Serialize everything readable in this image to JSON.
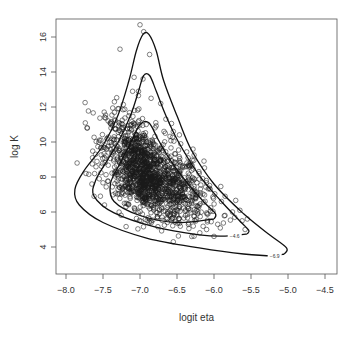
{
  "chart_data": {
    "type": "scatter",
    "title": "",
    "xlabel": "logit eta",
    "ylabel": "log K",
    "xlim": [
      -8.15,
      -4.35
    ],
    "ylim": [
      2.9,
      17.0
    ],
    "xticks": [
      -8.0,
      -7.5,
      -7.0,
      -6.5,
      -6.0,
      -5.5,
      -5.0,
      -4.5
    ],
    "xtick_labels": [
      "−8.0",
      "−7.5",
      "−7.0",
      "−6.5",
      "−6.0",
      "−5.5",
      "−5.0",
      "−4.5"
    ],
    "yticks": [
      4,
      6,
      8,
      10,
      12,
      14,
      16
    ],
    "ytick_labels": [
      "4",
      "6",
      "8",
      "10",
      "12",
      "14",
      "16"
    ],
    "grid": false,
    "legend": null,
    "marker": "open-circle",
    "point_color": "#1a1a1a",
    "contour_color": "#111111",
    "approx_n_points": 1500,
    "point_cloud": {
      "description": "dense cluster centered near logit eta = -6.9, log K = 8, skewed toward lower-right",
      "center": [
        -6.9,
        8.0
      ],
      "sd_x": 0.28,
      "sd_y": 1.25,
      "correlation": -0.55
    },
    "sparse_points": [
      [
        -7.0,
        16.7
      ],
      [
        -6.95,
        16.3
      ],
      [
        -7.27,
        15.3
      ],
      [
        -6.87,
        15.0
      ],
      [
        -7.08,
        13.7
      ],
      [
        -6.96,
        13.6
      ],
      [
        -7.6,
        9.3
      ],
      [
        -7.73,
        8.2
      ],
      [
        -7.85,
        8.8
      ],
      [
        -7.55,
        7.9
      ],
      [
        -7.62,
        6.9
      ],
      [
        -7.48,
        6.4
      ],
      [
        -7.65,
        7.6
      ],
      [
        -7.35,
        10.3
      ],
      [
        -7.25,
        10.8
      ],
      [
        -7.15,
        11.5
      ],
      [
        -6.72,
        12.2
      ],
      [
        -6.65,
        11.3
      ],
      [
        -6.55,
        10.6
      ],
      [
        -6.45,
        9.9
      ],
      [
        -6.35,
        9.1
      ],
      [
        -6.2,
        8.2
      ],
      [
        -6.05,
        7.3
      ],
      [
        -5.9,
        6.6
      ],
      [
        -5.75,
        6.0
      ],
      [
        -5.72,
        5.7
      ],
      [
        -5.62,
        5.5
      ],
      [
        -5.58,
        5.0
      ],
      [
        -5.95,
        5.3
      ],
      [
        -6.1,
        5.0
      ],
      [
        -6.55,
        4.3
      ],
      [
        -6.3,
        4.6
      ],
      [
        -5.55,
        5.6
      ],
      [
        -5.65,
        6.1
      ],
      [
        -7.1,
        12.9
      ],
      [
        -7.02,
        12.9
      ],
      [
        -6.85,
        12.5
      ],
      [
        -7.3,
        11.9
      ],
      [
        -6.5,
        8.8
      ],
      [
        -5.85,
        6.9
      ]
    ],
    "contours": [
      {
        "level": "-6.9",
        "label": "−6.9",
        "label_pos": [
          -5.18,
          3.5
        ],
        "path": [
          [
            -5.05,
            3.6
          ],
          [
            -5.2,
            3.5
          ],
          [
            -5.6,
            3.6
          ],
          [
            -6.2,
            3.95
          ],
          [
            -6.9,
            4.5
          ],
          [
            -7.5,
            5.4
          ],
          [
            -7.82,
            6.4
          ],
          [
            -7.88,
            7.3
          ],
          [
            -7.75,
            8.4
          ],
          [
            -7.5,
            9.8
          ],
          [
            -7.3,
            11.5
          ],
          [
            -7.15,
            13.5
          ],
          [
            -7.05,
            15.2
          ],
          [
            -6.96,
            16.15
          ],
          [
            -6.88,
            16.15
          ],
          [
            -6.78,
            15.2
          ],
          [
            -6.68,
            13.5
          ],
          [
            -6.5,
            11.5
          ],
          [
            -6.3,
            9.5
          ],
          [
            -6.0,
            7.6
          ],
          [
            -5.6,
            5.9
          ],
          [
            -5.25,
            4.7
          ],
          [
            -5.02,
            3.95
          ],
          [
            -5.05,
            3.6
          ]
        ]
      },
      {
        "level": "-4.6",
        "label": "−4.6",
        "label_pos": [
          -5.72,
          4.6
        ],
        "path": [
          [
            -5.55,
            4.75
          ],
          [
            -5.85,
            4.62
          ],
          [
            -6.2,
            4.7
          ],
          [
            -6.8,
            5.15
          ],
          [
            -7.35,
            5.95
          ],
          [
            -7.62,
            6.9
          ],
          [
            -7.6,
            7.8
          ],
          [
            -7.45,
            8.9
          ],
          [
            -7.28,
            10.1
          ],
          [
            -7.12,
            11.6
          ],
          [
            -7.02,
            12.9
          ],
          [
            -6.95,
            13.8
          ],
          [
            -6.87,
            13.8
          ],
          [
            -6.78,
            12.9
          ],
          [
            -6.66,
            11.6
          ],
          [
            -6.48,
            10.0
          ],
          [
            -6.2,
            8.1
          ],
          [
            -5.9,
            6.6
          ],
          [
            -5.63,
            5.4
          ],
          [
            -5.53,
            4.95
          ],
          [
            -5.55,
            4.75
          ]
        ]
      },
      {
        "level": "inner",
        "label": "",
        "path": [
          [
            -6.0,
            5.6
          ],
          [
            -6.5,
            5.4
          ],
          [
            -7.0,
            5.8
          ],
          [
            -7.35,
            6.6
          ],
          [
            -7.4,
            7.6
          ],
          [
            -7.28,
            8.7
          ],
          [
            -7.12,
            10.0
          ],
          [
            -7.0,
            11.0
          ],
          [
            -6.88,
            11.1
          ],
          [
            -6.75,
            10.1
          ],
          [
            -6.58,
            8.9
          ],
          [
            -6.35,
            7.6
          ],
          [
            -6.12,
            6.5
          ],
          [
            -5.98,
            5.9
          ],
          [
            -6.0,
            5.6
          ]
        ]
      }
    ],
    "plot_area_px": {
      "left": 56,
      "top": 19,
      "right": 337,
      "bottom": 274
    },
    "x_px_map": {
      "x0": -8.0,
      "px0": 66,
      "px_per_unit": 74
    },
    "y_px_map": {
      "y0": 16.0,
      "py0": 37,
      "px_per_unit": 17.5
    }
  }
}
